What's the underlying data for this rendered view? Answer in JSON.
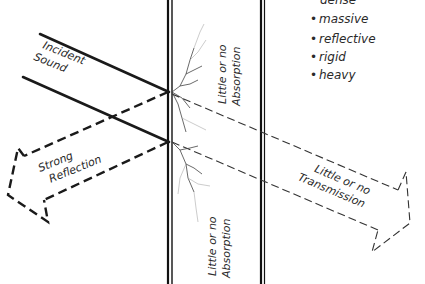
{
  "diagram": {
    "type": "sound-wall-interaction",
    "labels": {
      "incident": [
        "Incident",
        "Sound"
      ],
      "reflection": [
        "Strong",
        "Reflection"
      ],
      "transmission": [
        "Little or no",
        "Transmission"
      ],
      "absorption_top": [
        "Little or no",
        "Absorption"
      ],
      "absorption_bottom": [
        "Little or no",
        "Absorption"
      ]
    },
    "properties": {
      "partial_top": "dense",
      "items": [
        "massive",
        "reflective",
        "rigid",
        "heavy"
      ],
      "bullet": "•"
    }
  }
}
